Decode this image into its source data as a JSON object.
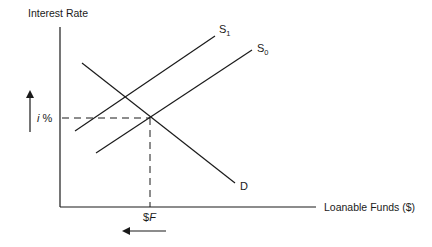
{
  "diagram": {
    "y_axis_label": "Interest Rate",
    "x_axis_label": "Loanable Funds ($)",
    "curves": [
      {
        "id": "S1",
        "base": "S",
        "subscript": "1",
        "type": "supply",
        "x1": 75,
        "y1": 131,
        "x2": 215,
        "y2": 36
      },
      {
        "id": "S0",
        "base": "S",
        "subscript": "0",
        "type": "supply",
        "x1": 96,
        "y1": 153,
        "x2": 252,
        "y2": 50
      },
      {
        "id": "D",
        "base": "D",
        "subscript": "",
        "type": "demand",
        "x1": 82,
        "y1": 63,
        "x2": 235,
        "y2": 183
      }
    ],
    "equilibrium": {
      "rate_label": "i %",
      "rate_label_italic_part": "i",
      "rate_label_rest": " %",
      "quantity_label": "$F",
      "quantity_label_prefix": "$",
      "quantity_label_italic_part": "F",
      "x": 150,
      "y": 118
    },
    "arrows": [
      {
        "id": "interest-rate-up",
        "direction": "up",
        "meaning": "interest rate rises"
      },
      {
        "id": "loanable-funds-left",
        "direction": "left",
        "meaning": "quantity of loanable funds falls"
      }
    ],
    "colors": {
      "line": "#1a1a1a",
      "background": "#ffffff"
    }
  }
}
